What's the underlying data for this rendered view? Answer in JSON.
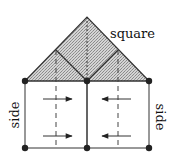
{
  "diagram": {
    "labels": {
      "roof": "square",
      "left_wall": "side",
      "right_wall": "side"
    },
    "colors": {
      "stroke": "#222222",
      "fill_hatch": "#bdbdbd",
      "dot": "#222222",
      "background": "#ffffff"
    },
    "nodes": [
      {
        "id": "apex",
        "x": 87,
        "y": 17
      },
      {
        "id": "left-sub-apex",
        "x": 56,
        "y": 50
      },
      {
        "id": "right-sub-apex",
        "x": 118,
        "y": 50
      },
      {
        "id": "top-left",
        "x": 25,
        "y": 81
      },
      {
        "id": "top-mid",
        "x": 87,
        "y": 81
      },
      {
        "id": "top-right",
        "x": 149,
        "y": 81
      },
      {
        "id": "bottom-left",
        "x": 25,
        "y": 148
      },
      {
        "id": "bottom-mid",
        "x": 87,
        "y": 148
      },
      {
        "id": "bottom-right",
        "x": 149,
        "y": 148
      }
    ],
    "arrows": [
      {
        "panel": "left",
        "y": 99,
        "direction": "right"
      },
      {
        "panel": "left",
        "y": 136,
        "direction": "right"
      },
      {
        "panel": "right",
        "y": 99,
        "direction": "left"
      },
      {
        "panel": "right",
        "y": 136,
        "direction": "left"
      }
    ]
  }
}
